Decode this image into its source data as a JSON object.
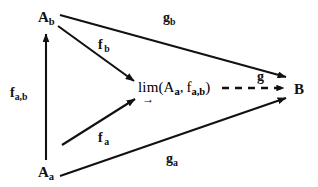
{
  "diagram": {
    "background_color": "#ffffff",
    "stroke_color": "#111111",
    "nodes": {
      "top_left": {
        "base": "A",
        "sub": "b",
        "x": 38,
        "y": 10
      },
      "bottom_left": {
        "base": "A",
        "sub": "a",
        "x": 38,
        "y": 165
      },
      "right": {
        "base": "B",
        "sub": "",
        "x": 294,
        "y": 84
      },
      "center": {
        "operator": "lim",
        "operator_arrow": "→",
        "open_paren": "(",
        "arg1_base": "A",
        "arg1_sub": "a",
        "separator": ", ",
        "arg2_base": "f",
        "arg2_sub": "a,b",
        "close_paren": ")",
        "x": 138,
        "y": 84
      }
    },
    "edges": [
      {
        "id": "f-ab",
        "label_base": "f",
        "label_sub": "a,b",
        "from": "bottom_left",
        "to": "top_left",
        "style": "solid",
        "label_x": 10,
        "label_y": 86
      },
      {
        "id": "f-b",
        "label_base": "f",
        "label_sub": "b",
        "from": "top_left",
        "to": "center",
        "style": "solid",
        "label_x": 98,
        "label_y": 38
      },
      {
        "id": "f-a",
        "label_base": "f",
        "label_sub": "a",
        "from": "bottom_left",
        "to": "center",
        "style": "solid",
        "label_x": 98,
        "label_y": 131
      },
      {
        "id": "g-b",
        "label_base": "g",
        "label_sub": "b",
        "from": "top_left",
        "to": "right",
        "style": "solid",
        "label_x": 163,
        "label_y": 11
      },
      {
        "id": "g-a",
        "label_base": "g",
        "label_sub": "a",
        "from": "bottom_left",
        "to": "right",
        "style": "solid",
        "label_x": 166,
        "label_y": 152
      },
      {
        "id": "g",
        "label_base": "g",
        "label_sub": "",
        "from": "center",
        "to": "right",
        "style": "dashed",
        "label_x": 257,
        "label_y": 72
      }
    ]
  }
}
